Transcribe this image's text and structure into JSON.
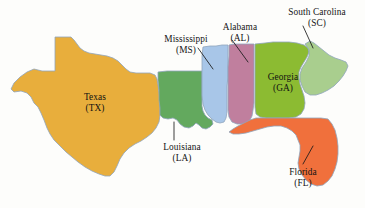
{
  "figure": {
    "background_color": "#fdfdfb",
    "border_color": "#8fa4bd",
    "leader_color": "#1a1a1a",
    "text_color": "#141414"
  },
  "states": [
    {
      "key": "texas",
      "name": "Texas",
      "abbr": "(TX)",
      "abbreviation_code": "TX",
      "color": "#e8ae3c",
      "label_style": "inside",
      "label_left": 67,
      "label_top": 92,
      "has_leader": false
    },
    {
      "key": "louisiana",
      "name": "Louisiana",
      "abbr": "(LA)",
      "abbreviation_code": "LA",
      "color": "#63a95e",
      "label_style": "outside",
      "label_left": 151,
      "label_top": 142,
      "has_leader": true
    },
    {
      "key": "mississippi",
      "name": "Mississippi",
      "abbr": "(MS)",
      "abbreviation_code": "MS",
      "color": "#a8c6e8",
      "label_style": "outside",
      "label_left": 152,
      "label_top": 34,
      "has_leader": true
    },
    {
      "key": "alabama",
      "name": "Alabama",
      "abbr": "(AL)",
      "abbreviation_code": "AL",
      "color": "#c07f9e",
      "label_style": "outside",
      "label_left": 212,
      "label_top": 22,
      "has_leader": true
    },
    {
      "key": "georgia",
      "name": "Georgia",
      "abbr": "(GA)",
      "abbreviation_code": "GA",
      "color": "#8cbb32",
      "label_style": "inside",
      "label_left": 256,
      "label_top": 72,
      "has_leader": false
    },
    {
      "key": "south_carolina",
      "name": "South Carolina",
      "abbr": "(SC)",
      "abbreviation_code": "SC",
      "color": "#a9ce8e",
      "label_style": "outside",
      "label_left": 276,
      "label_top": 7,
      "has_leader": true
    },
    {
      "key": "florida",
      "name": "Florida",
      "abbr": "(FL)",
      "abbreviation_code": "FL",
      "color": "#f0703c",
      "label_style": "outside",
      "label_left": 277,
      "label_top": 167,
      "has_leader": true
    }
  ]
}
